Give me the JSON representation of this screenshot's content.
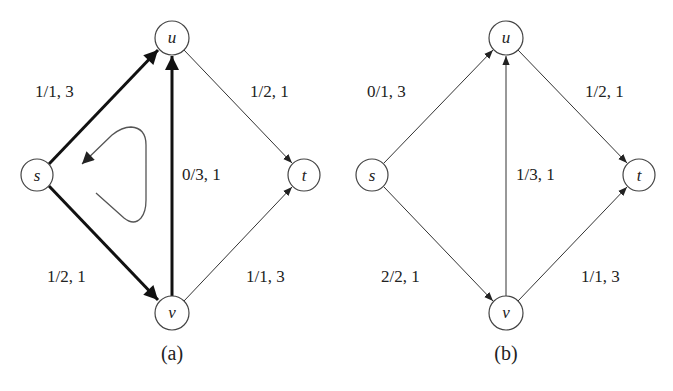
{
  "diagrams": [
    {
      "id": "a",
      "caption": "(a)",
      "nodes": [
        {
          "name": "s",
          "label": "s",
          "x": 37,
          "y": 175
        },
        {
          "name": "u",
          "label": "u",
          "x": 172,
          "y": 38
        },
        {
          "name": "t",
          "label": "t",
          "x": 304,
          "y": 175
        },
        {
          "name": "v",
          "label": "v",
          "x": 172,
          "y": 313
        }
      ],
      "edges": [
        {
          "from": "s",
          "to": "u",
          "label": "1/1, 3",
          "highlighted": true
        },
        {
          "from": "u",
          "to": "t",
          "label": "1/2, 1",
          "highlighted": false
        },
        {
          "from": "v",
          "to": "u",
          "label": "0/3, 1",
          "highlighted": true
        },
        {
          "from": "s",
          "to": "v",
          "label": "1/2, 1",
          "highlighted": true
        },
        {
          "from": "v",
          "to": "t",
          "label": "1/1, 3",
          "highlighted": false
        }
      ],
      "annotation": "cycle-arrow"
    },
    {
      "id": "b",
      "caption": "(b)",
      "nodes": [
        {
          "name": "s",
          "label": "s",
          "x": 372,
          "y": 175
        },
        {
          "name": "u",
          "label": "u",
          "x": 506,
          "y": 38
        },
        {
          "name": "t",
          "label": "t",
          "x": 639,
          "y": 175
        },
        {
          "name": "v",
          "label": "v",
          "x": 506,
          "y": 313
        }
      ],
      "edges": [
        {
          "from": "s",
          "to": "u",
          "label": "0/1, 3",
          "highlighted": false
        },
        {
          "from": "u",
          "to": "t",
          "label": "1/2, 1",
          "highlighted": false
        },
        {
          "from": "v",
          "to": "u",
          "label": "1/3, 1",
          "highlighted": false
        },
        {
          "from": "s",
          "to": "v",
          "label": "2/2, 1",
          "highlighted": false
        },
        {
          "from": "v",
          "to": "t",
          "label": "1/1, 3",
          "highlighted": false
        }
      ]
    }
  ]
}
